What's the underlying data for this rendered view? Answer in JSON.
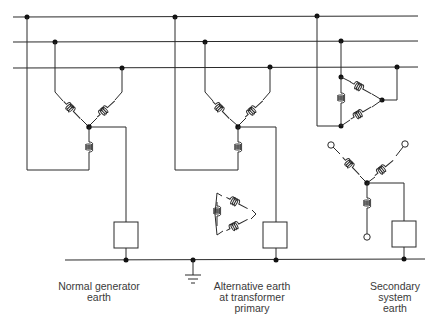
{
  "diagram": {
    "type": "earthing-arrangements-schematic",
    "busbars": [
      "phase-1",
      "phase-2",
      "phase-3"
    ],
    "sections": [
      {
        "id": "normal-generator-earth",
        "label_lines": [
          "Normal generator",
          "earth"
        ],
        "winding": "star"
      },
      {
        "id": "alternative-earth",
        "label_lines": [
          "Alternative earth",
          "at transformer",
          "primary"
        ],
        "winding": "star",
        "secondary_winding": "delta"
      },
      {
        "id": "secondary-system-earth",
        "label_lines": [
          "Secondary",
          "system",
          "earth"
        ],
        "winding": "delta",
        "secondary_winding": "star"
      }
    ],
    "colors": {
      "line": "#2a2a2a",
      "text": "#3a3a3a",
      "background": "#ffffff"
    }
  }
}
